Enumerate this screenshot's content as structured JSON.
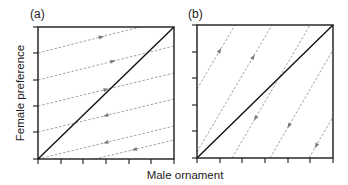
{
  "figure": {
    "panel_a": {
      "label": "(a)",
      "frame": {
        "x0": 38,
        "y0": 27,
        "x1": 174,
        "y1": 159
      },
      "x_ticks": [
        38,
        61,
        83,
        106,
        129,
        151,
        174
      ],
      "y_ticks": [
        27,
        53,
        80,
        106,
        132,
        159
      ],
      "trajectories": [
        {
          "from": [
            38,
            53
          ],
          "to": [
            140,
            27
          ],
          "arrow_at": 0.62,
          "dir": 1
        },
        {
          "from": [
            38,
            80
          ],
          "to": [
            174,
            46
          ],
          "arrow_at": 0.55,
          "dir": 1
        },
        {
          "from": [
            38,
            106
          ],
          "to": [
            174,
            73
          ],
          "arrow_at": 0.5,
          "dir": 1
        },
        {
          "from": [
            38,
            132
          ],
          "to": [
            174,
            99
          ],
          "arrow_at": 0.5,
          "dir": -1
        },
        {
          "from": [
            38,
            159
          ],
          "to": [
            174,
            126
          ],
          "arrow_at": 0.5,
          "dir": -1
        },
        {
          "from": [
            95,
            159
          ],
          "to": [
            174,
            140
          ],
          "arrow_at": 0.5,
          "dir": -1
        }
      ],
      "arrows_above_diagonal": "right",
      "arrows_below_diagonal": "left"
    },
    "panel_b": {
      "label": "(b)",
      "frame": {
        "x0": 197,
        "y0": 25,
        "x1": 333,
        "y1": 158
      },
      "x_ticks": [
        197,
        220,
        242,
        265,
        288,
        310,
        333
      ],
      "y_ticks": [
        25,
        52,
        78,
        105,
        131,
        158
      ],
      "trajectories": [
        {
          "from": [
            197,
            89
          ],
          "to": [
            235,
            25
          ],
          "arrow_at": 0.6,
          "dir": 1
        },
        {
          "from": [
            197,
            152
          ],
          "to": [
            272,
            25
          ],
          "arrow_at": 0.75,
          "dir": 1
        },
        {
          "from": [
            232,
            158
          ],
          "to": [
            310,
            25
          ],
          "arrow_at": 0.3,
          "dir": -1
        },
        {
          "from": [
            270,
            158
          ],
          "to": [
            333,
            50
          ],
          "arrow_at": 0.3,
          "dir": -1
        },
        {
          "from": [
            309,
            158
          ],
          "to": [
            333,
            117
          ],
          "arrow_at": 0.3,
          "dir": -1
        }
      ],
      "arrows_above_diagonal": "up",
      "arrows_below_diagonal": "down"
    },
    "y_axis_label": "Female preference",
    "x_axis_label": "Male ornament",
    "colors": {
      "axis": "#1a1a1a",
      "diagonal": "#111111",
      "trajectory": "#8a8a8a"
    }
  }
}
